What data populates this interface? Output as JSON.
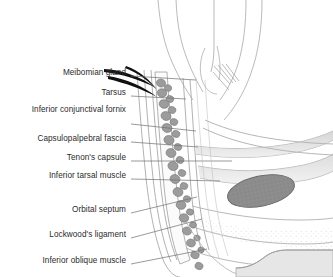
{
  "figure": {
    "title_visible": false,
    "background_color": "#ffffff",
    "type": "anatomical-cross-section"
  },
  "labels": [
    {
      "id": "meibomian-gland",
      "text": "Meibomian gland",
      "x_right": 126,
      "y": 73,
      "leader_to_x": 196,
      "leader_to_y": 80,
      "multiline": false
    },
    {
      "id": "tarsus",
      "text": "Tarsus",
      "x_right": 126,
      "y": 93,
      "leader_to_x": 186,
      "leader_to_y": 98,
      "multiline": false
    },
    {
      "id": "inferior-conjunctival-fornix",
      "text": "Inferior conjunctival fornix",
      "x_right": 126,
      "y": 110,
      "leader_to_x": 196,
      "leader_to_y": 130,
      "multiline": true
    },
    {
      "id": "capsulopalpebral-fascia",
      "text": "Capsulopalpebral fascia",
      "x_right": 126,
      "y": 139,
      "leader_to_x": 196,
      "leader_to_y": 146,
      "multiline": false
    },
    {
      "id": "tenons-capsule",
      "text": "Tenon's capsule",
      "x_right": 126,
      "y": 158,
      "leader_to_x": 230,
      "leader_to_y": 160,
      "multiline": false
    },
    {
      "id": "inferior-tarsal-muscle",
      "text": "Inferior tarsal muscle",
      "x_right": 126,
      "y": 176,
      "leader_to_x": 218,
      "leader_to_y": 180,
      "multiline": false
    },
    {
      "id": "orbital-septum",
      "text": "Orbital septum",
      "x_right": 126,
      "y": 210,
      "leader_to_x": 196,
      "leader_to_y": 196,
      "multiline": false
    },
    {
      "id": "lockwoods-ligament",
      "text": "Lockwood's ligament",
      "x_right": 126,
      "y": 235,
      "leader_to_x": 200,
      "leader_to_y": 218,
      "multiline": false
    },
    {
      "id": "inferior-oblique-muscle",
      "text": "Inferior oblique muscle",
      "x_right": 126,
      "y": 261,
      "leader_to_x": 205,
      "leader_to_y": 248,
      "multiline": false
    }
  ],
  "structures": [
    {
      "id": "eyelashes",
      "name": "eyelashes",
      "color": "#101010"
    },
    {
      "id": "meibomian-gland-chain",
      "name": "meibomian gland lobules",
      "color": "#9a9a9a"
    },
    {
      "id": "inferior-oblique-belly",
      "name": "inferior oblique muscle cross-section",
      "color": "#8a8a8a"
    },
    {
      "id": "orbital-fat",
      "name": "orbital fat stipple",
      "color": "#d8d8d8"
    },
    {
      "id": "globe-sclera",
      "name": "globe and sclera curve",
      "color": "#b4b4b4"
    },
    {
      "id": "caruncle",
      "name": "caruncle / plica",
      "color": "#c0c0c0"
    }
  ],
  "palette": {
    "ink": "#2b2b2b",
    "leader_line": "#6e6e6e",
    "outline_light": "#b0b0b0",
    "outline_mid": "#8c8c8c",
    "fill_gland": "#9c9c9c",
    "fill_muscle": "#8a8a8a",
    "fill_fat": "#dedede",
    "black": "#101010"
  }
}
